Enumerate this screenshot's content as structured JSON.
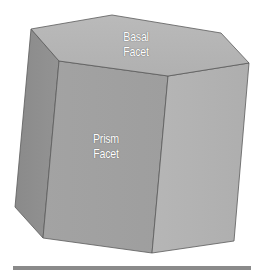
{
  "diagram": {
    "labels": {
      "basal": [
        "Basal",
        "Facet"
      ],
      "prism": [
        "Prism",
        "Facet"
      ]
    },
    "colors": {
      "basal_face": "#b5b5b5",
      "front_face": "#a4a4a4",
      "left_face": "#8d8d8d",
      "right_face": "#b0b0b0",
      "edge": "#5a5a5a",
      "bar": "#8a8a8a"
    }
  }
}
